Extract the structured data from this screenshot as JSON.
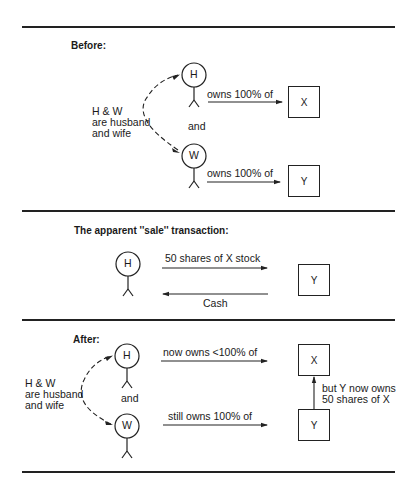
{
  "sections": {
    "before": {
      "title": "Before:",
      "relationship_note": "H & W\nare husband\nand wife",
      "connector": "and",
      "persons": [
        {
          "id": "H",
          "label": "H"
        },
        {
          "id": "W",
          "label": "W"
        }
      ],
      "arrows": [
        {
          "from": "H",
          "to": "X",
          "label": "owns 100% of"
        },
        {
          "from": "W",
          "to": "Y",
          "label": "owns 100% of"
        }
      ],
      "companies": [
        {
          "id": "X",
          "label": "X"
        },
        {
          "id": "Y",
          "label": "Y"
        }
      ]
    },
    "sale": {
      "title": "The apparent ''sale'' transaction:",
      "person": {
        "id": "H",
        "label": "H"
      },
      "company": {
        "id": "Y",
        "label": "Y"
      },
      "arrows": [
        {
          "from": "H",
          "to": "Y",
          "label": "50 shares of X stock"
        },
        {
          "from": "Y",
          "to": "H",
          "label": "Cash"
        }
      ]
    },
    "after": {
      "title": "After:",
      "relationship_note": "H & W\nare husband\nand wife",
      "connector": "and",
      "persons": [
        {
          "id": "H",
          "label": "H"
        },
        {
          "id": "W",
          "label": "W"
        }
      ],
      "arrows": [
        {
          "from": "H",
          "to": "X",
          "label": "now owns <100% of"
        },
        {
          "from": "W",
          "to": "Y",
          "label": "still owns 100% of"
        },
        {
          "from": "Y",
          "to": "X",
          "label": "but Y now owns\n50 shares of X"
        }
      ],
      "companies": [
        {
          "id": "X",
          "label": "X"
        },
        {
          "id": "Y",
          "label": "Y"
        }
      ]
    }
  }
}
